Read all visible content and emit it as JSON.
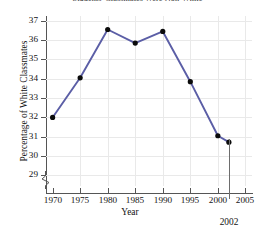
{
  "chart_data": {
    "type": "line",
    "title": "Students' Classmates Were Non-White",
    "xlabel": "Year",
    "ylabel": "Percentage of White Classmates",
    "x": [
      1970,
      1975,
      1980,
      1985,
      1990,
      1995,
      2000,
      2002
    ],
    "values": [
      32.0,
      34.05,
      36.55,
      35.85,
      36.45,
      33.85,
      31.05,
      30.72
    ],
    "series": [
      {
        "name": "Percentage of White Classmates",
        "values": [
          32.0,
          34.05,
          36.55,
          35.85,
          36.45,
          33.85,
          31.05,
          30.72
        ]
      }
    ],
    "xlim": [
      1968.8,
      2006.2
    ],
    "ylim": [
      28.45,
      37.25
    ],
    "x_tick_labels": [
      "1970",
      "1975",
      "1980",
      "1985",
      "1990",
      "1995",
      "2000",
      "2005"
    ],
    "x_ticks": [
      1970,
      1975,
      1980,
      1985,
      1990,
      1995,
      2000,
      2005
    ],
    "y_tick_labels": [
      "29",
      "30",
      "31",
      "32",
      "33",
      "34",
      "35",
      "36",
      "37"
    ],
    "y_ticks": [
      29,
      30,
      31,
      32,
      33,
      34,
      35,
      36,
      37
    ],
    "grid": true,
    "legend": "none",
    "y_axis_break": true,
    "annotations": [
      {
        "label": "2002",
        "x": 2002,
        "type": "x-axis-callout"
      }
    ],
    "colors": {
      "line": "#5b5ea6",
      "marker": "#0b0b0b",
      "grid": "#e9e9e9",
      "axis": "#555555",
      "background": "#ffffff",
      "text": "#131313"
    },
    "line_width_px": 1.9,
    "marker_radius_px": 2.6,
    "marker_shape": "circle"
  }
}
